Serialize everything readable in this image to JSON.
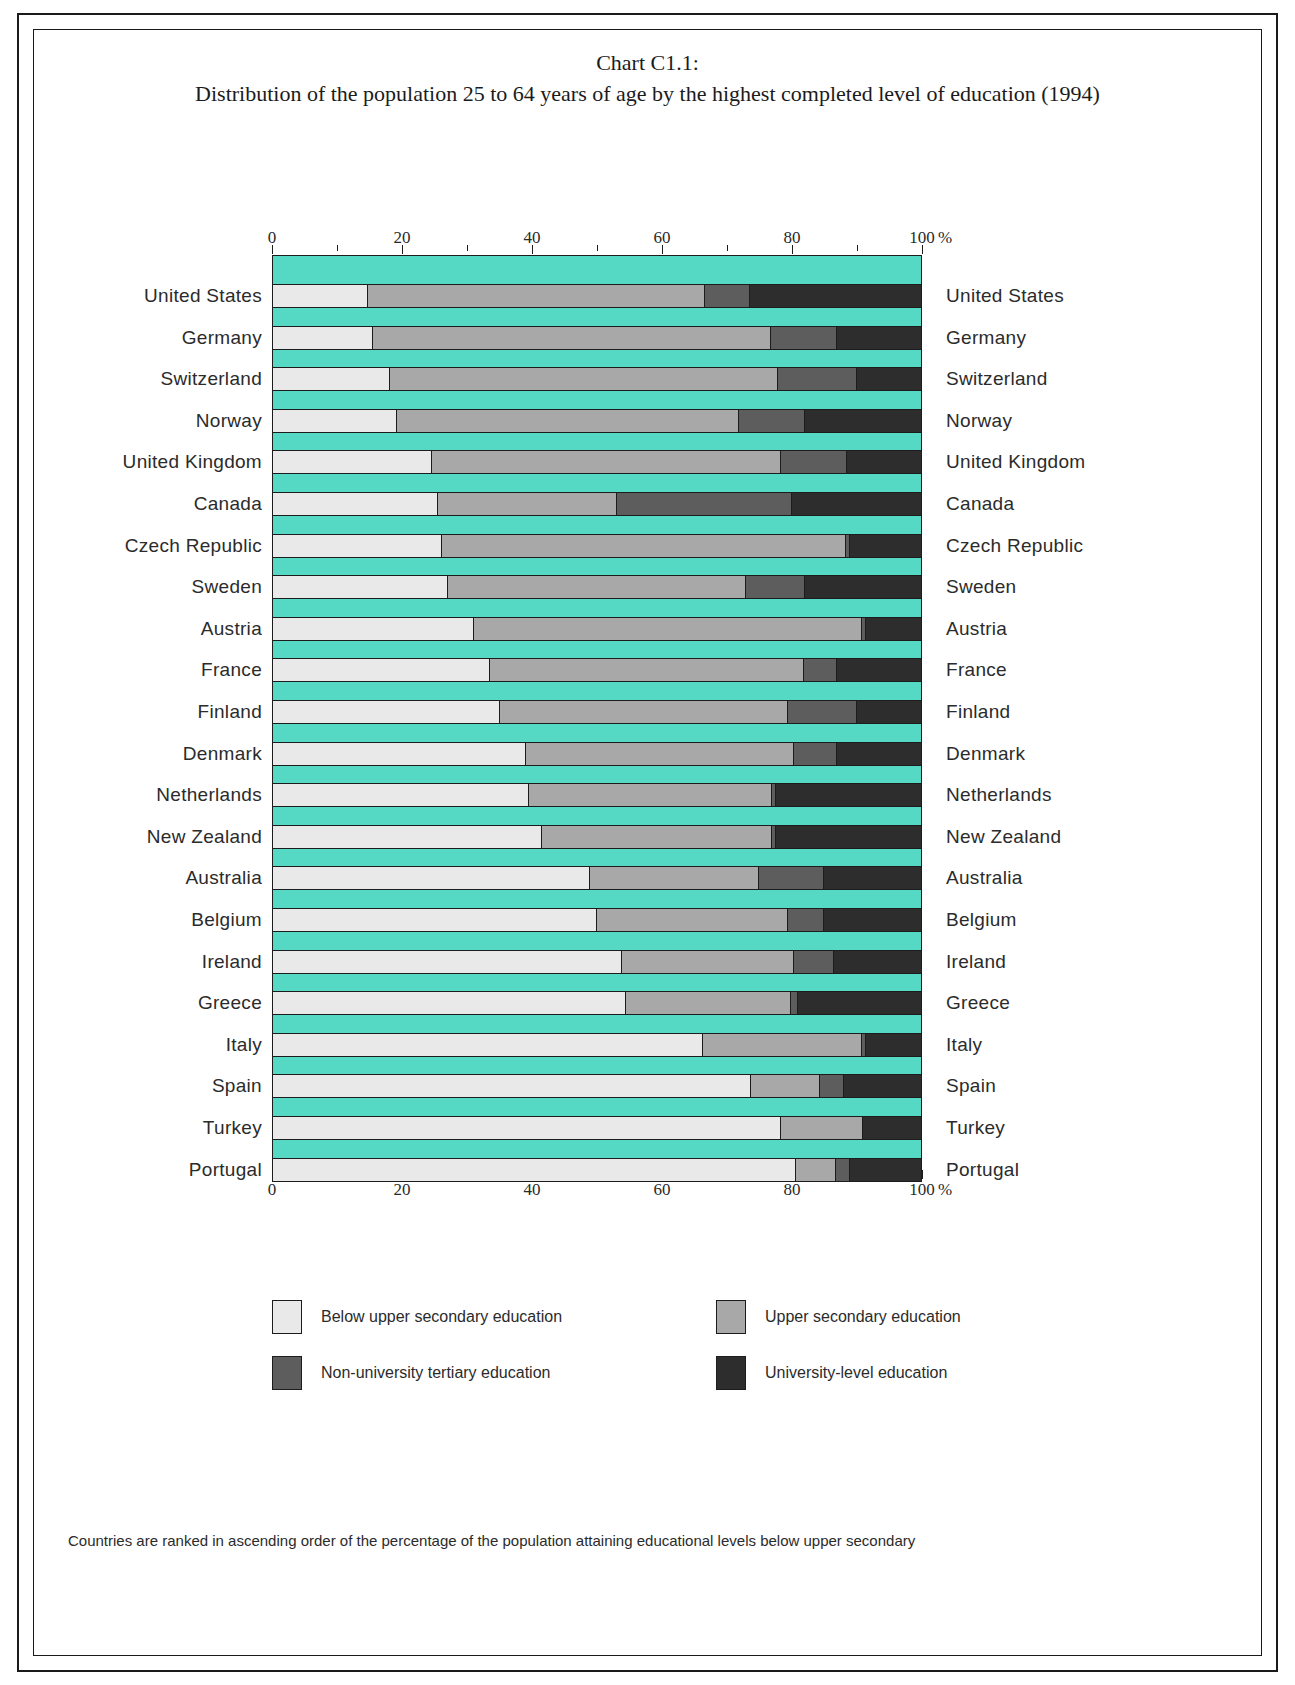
{
  "title": {
    "line1": "Chart C1.1:",
    "line2": "Distribution of the population 25 to 64 years of age by the highest completed level of education (1994)"
  },
  "axis": {
    "unit": "%",
    "tick_labels": [
      "0",
      "20",
      "40",
      "60",
      "80",
      "100"
    ]
  },
  "legend": [
    {
      "label": "Below upper secondary education",
      "color": "#e9e9e9"
    },
    {
      "label": "Upper secondary education",
      "color": "#a8a8a8"
    },
    {
      "label": "Non-university tertiary education",
      "color": "#5d5d5d"
    },
    {
      "label": "University-level education",
      "color": "#2d2d2d"
    }
  ],
  "footnote": "Countries are ranked in ascending order of the percentage of the population attaining educational levels below upper secondary",
  "chart_data": {
    "type": "bar",
    "orientation": "horizontal",
    "stacked": true,
    "normalized_to_percent": true,
    "title": "Chart C1.1: Distribution of the population 25 to 64 years of age by the highest completed level of education (1994)",
    "xlabel": "%",
    "ylabel": "",
    "xlim": [
      0,
      100
    ],
    "xticks": [
      0,
      20,
      40,
      60,
      80,
      100
    ],
    "minor_tick_interval": 10,
    "grid": false,
    "legend_position": "bottom",
    "background_color": "#56d9c4",
    "series": [
      {
        "name": "Below upper secondary education",
        "color": "#e9e9e9",
        "values": [
          14.6,
          15.4,
          18.0,
          19.0,
          24.5,
          25.5,
          26.0,
          27.0,
          31.0,
          33.5,
          35.0,
          39.0,
          39.5,
          41.5,
          49.0,
          50.0,
          54.0,
          54.5,
          66.5,
          74.0,
          78.5,
          81.0
        ]
      },
      {
        "name": "Upper secondary education",
        "color": "#a8a8a8",
        "values": [
          52.0,
          61.5,
          60.0,
          53.0,
          54.0,
          27.5,
          62.5,
          46.0,
          60.0,
          48.5,
          44.5,
          41.5,
          37.5,
          35.5,
          26.0,
          29.5,
          26.5,
          25.5,
          24.5,
          10.5,
          12.5,
          6.0
        ]
      },
      {
        "name": "Non-university tertiary education",
        "color": "#5d5d5d",
        "values": [
          6.9,
          10.0,
          12.0,
          10.0,
          10.0,
          27.0,
          0.5,
          9.0,
          0.5,
          5.0,
          10.5,
          6.5,
          0.5,
          0.5,
          10.0,
          5.5,
          6.0,
          1.0,
          0.5,
          3.5,
          0.0,
          2.0
        ]
      },
      {
        "name": "University-level education",
        "color": "#2d2d2d",
        "values": [
          26.5,
          13.1,
          10.0,
          18.0,
          11.5,
          20.0,
          11.0,
          18.0,
          8.5,
          13.0,
          10.0,
          13.0,
          22.5,
          22.5,
          15.0,
          15.0,
          13.5,
          19.0,
          8.5,
          12.0,
          9.0,
          11.0
        ]
      }
    ],
    "categories": [
      "United States",
      "Germany",
      "Switzerland",
      "Norway",
      "United Kingdom",
      "Canada",
      "Czech Republic",
      "Sweden",
      "Austria",
      "France",
      "Finland",
      "Denmark",
      "Netherlands",
      "New Zealand",
      "Australia",
      "Belgium",
      "Ireland",
      "Greece",
      "Italy",
      "Spain",
      "Turkey",
      "Portugal"
    ]
  }
}
